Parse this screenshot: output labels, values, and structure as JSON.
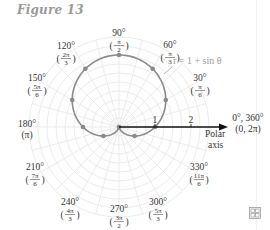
{
  "figure": {
    "title": "Figure 13"
  },
  "chart_data": {
    "type": "line",
    "subtype": "polar",
    "title": "Figure 13",
    "equation_label": "r = 1 + sin θ",
    "curve": "cardioid r = 1 + sin(theta)",
    "grid": {
      "rings_step": 0.25,
      "rings_max": 2.5,
      "radial_step_deg": 15,
      "on": true
    },
    "axis": {
      "polar_axis_label_line1": "Polar",
      "polar_axis_label_line2": "axis",
      "ticks": [
        {
          "value": 1,
          "label": "1"
        },
        {
          "value": 2,
          "label": "2"
        }
      ]
    },
    "angle_labels": [
      {
        "deg": 0,
        "line1": "0°, 360°",
        "line2": "(0, 2π)"
      },
      {
        "deg": 30,
        "line1": "30°",
        "num": "π",
        "den": "6"
      },
      {
        "deg": 60,
        "line1": "60°",
        "num": "π",
        "den": "3"
      },
      {
        "deg": 90,
        "line1": "90°",
        "num": "π",
        "den": "2"
      },
      {
        "deg": 120,
        "line1": "120°",
        "num": "2π",
        "den": "3"
      },
      {
        "deg": 150,
        "line1": "150°",
        "num": "5π",
        "den": "6"
      },
      {
        "deg": 180,
        "line1": "180°",
        "line2": "(π)"
      },
      {
        "deg": 210,
        "line1": "210°",
        "num": "7π",
        "den": "6"
      },
      {
        "deg": 240,
        "line1": "240°",
        "num": "4π",
        "den": "3"
      },
      {
        "deg": 270,
        "line1": "270°",
        "num": "3π",
        "den": "2"
      },
      {
        "deg": 300,
        "line1": "300°",
        "num": "5π",
        "den": "3"
      },
      {
        "deg": 330,
        "line1": "330°",
        "num": "11π",
        "den": "6"
      }
    ],
    "points": [
      {
        "theta_deg": 0,
        "r": 1.0
      },
      {
        "theta_deg": 30,
        "r": 1.5
      },
      {
        "theta_deg": 60,
        "r": 1.87
      },
      {
        "theta_deg": 90,
        "r": 2.0
      },
      {
        "theta_deg": 120,
        "r": 1.87
      },
      {
        "theta_deg": 150,
        "r": 1.5
      },
      {
        "theta_deg": 180,
        "r": 1.0
      },
      {
        "theta_deg": 210,
        "r": 0.5
      },
      {
        "theta_deg": 270,
        "r": 0.0
      },
      {
        "theta_deg": 330,
        "r": 0.5
      }
    ],
    "colors": {
      "curve": "#8a8a8a",
      "grid": "#e3e3e3",
      "axis": "#111111",
      "points": "#8a8a8a"
    }
  },
  "corner_icon": "grid-table-icon"
}
